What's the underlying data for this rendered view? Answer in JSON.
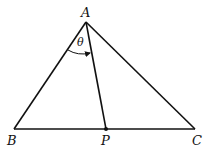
{
  "diagram": {
    "title": "",
    "vertices": {
      "A": {
        "label": "A",
        "x": 86,
        "y": 22
      },
      "B": {
        "label": "B",
        "x": 14,
        "y": 129
      },
      "C": {
        "label": "C",
        "x": 195,
        "y": 129
      },
      "P": {
        "label": "P",
        "x": 106,
        "y": 129
      }
    },
    "segments": [
      {
        "from": "A",
        "to": "B"
      },
      {
        "from": "A",
        "to": "C"
      },
      {
        "from": "B",
        "to": "C"
      },
      {
        "from": "A",
        "to": "P"
      }
    ],
    "angle": {
      "label": "θ",
      "at": "A",
      "between": [
        "AB",
        "AP"
      ],
      "arrow": "toward AP"
    },
    "point_marker": "P",
    "colors": {
      "stroke": "#111111",
      "background": "#ffffff"
    }
  }
}
